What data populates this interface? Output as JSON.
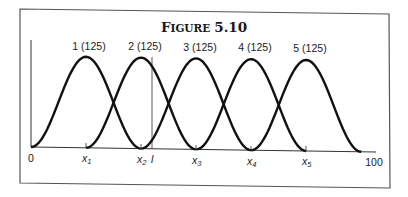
{
  "figure": {
    "title_first": "F",
    "title_rest": "IGURE",
    "title_num": "5.10"
  },
  "chart_data": {
    "type": "line",
    "xlabel": "",
    "ylabel": "",
    "xlim": [
      0,
      100
    ],
    "x_tick_labels": [
      "0",
      "100"
    ],
    "x_markers": [
      {
        "label": "x1",
        "x": 16
      },
      {
        "label": "x2",
        "x": 32
      },
      {
        "label": "x3",
        "x": 48
      },
      {
        "label": "x4",
        "x": 64
      },
      {
        "label": "x5",
        "x": 80
      }
    ],
    "vertical_marker": {
      "label": "l",
      "x": 35
    },
    "series": [
      {
        "name": "1 (125)",
        "center": 16,
        "half_width": 16,
        "peak": 125
      },
      {
        "name": "2 (125)",
        "center": 32,
        "half_width": 16,
        "peak": 125
      },
      {
        "name": "3 (125)",
        "center": 48,
        "half_width": 16,
        "peak": 125
      },
      {
        "name": "4 (125)",
        "center": 64,
        "half_width": 16,
        "peak": 125
      },
      {
        "name": "5 (125)",
        "center": 80,
        "half_width": 16,
        "peak": 125
      }
    ],
    "grid": false,
    "legend": "labels above peaks"
  },
  "labels": {
    "curves": [
      "1 (125)",
      "2 (125)",
      "3 (125)",
      "4 (125)",
      "5 (125)"
    ],
    "axis_start": "0",
    "axis_end": "100",
    "marker_prefix": "x",
    "markers": [
      "1",
      "2",
      "3",
      "4",
      "5"
    ],
    "vline": "l"
  }
}
